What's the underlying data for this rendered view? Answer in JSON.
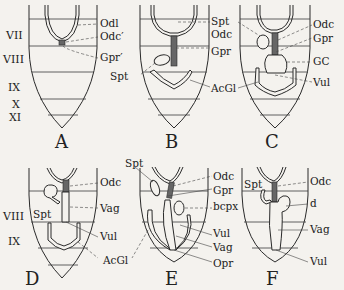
{
  "figure": {
    "panels": [
      {
        "id": "A",
        "label": "A",
        "labels": [
          "Odl",
          "Odc′",
          "Gpr′",
          "Spt"
        ]
      },
      {
        "id": "B",
        "label": "B",
        "labels": [
          "Spt",
          "Odc",
          "Gpr",
          "AcGl"
        ]
      },
      {
        "id": "C",
        "label": "C",
        "labels": [
          "Spt",
          "Odc",
          "Gpr",
          "GC",
          "AcGl",
          "Vul"
        ]
      },
      {
        "id": "D",
        "label": "D",
        "labels": [
          "Odc",
          "Spt",
          "Vag",
          "Vul",
          "AcGl"
        ]
      },
      {
        "id": "E",
        "label": "E",
        "labels": [
          "Spt",
          "Odc",
          "Gpr",
          "bcpx",
          "Vul",
          "Vag",
          "Opr"
        ]
      },
      {
        "id": "F",
        "label": "F",
        "labels": [
          "Spt",
          "Odc",
          "d",
          "Vag",
          "Vul"
        ]
      }
    ],
    "segment_labels_top": [
      "VII",
      "VIII",
      "IX",
      "X",
      "XI"
    ],
    "segment_labels_bottom": [
      "VIII",
      "IX"
    ]
  },
  "text": {
    "A": {
      "fig": "A",
      "odl": "Odl",
      "odc": "Odc′",
      "gpr": "Gpr′"
    },
    "B": {
      "fig": "B",
      "spt_left": "Spt",
      "odc": "Odc",
      "gpr": "Gpr",
      "acgl": "AcGl"
    },
    "C": {
      "fig": "C",
      "spt": "Spt",
      "odc": "Odc",
      "gpr": "Gpr",
      "gc": "GC",
      "acgl": "AcGl",
      "vul": "Vul"
    },
    "D": {
      "fig": "D",
      "odc": "Odc",
      "spt": "Spt",
      "vag": "Vag",
      "vul": "Vul",
      "acgl": "AcGl"
    },
    "E": {
      "fig": "E",
      "spt": "Spt",
      "odc": "Odc",
      "gpr": "Gpr",
      "bcpx": "bcpx",
      "vul": "Vul",
      "vag": "Vag",
      "opr": "Opr"
    },
    "F": {
      "fig": "F",
      "spt": "Spt",
      "odc": "Odc",
      "d": "d",
      "vag": "Vag",
      "vul": "Vul"
    },
    "seg_top": {
      "vii": "VII",
      "viii": "VIII",
      "ix": "IX",
      "x": "X",
      "xi": "XI"
    },
    "seg_bottom": {
      "viii": "VIII",
      "ix": "IX"
    }
  }
}
